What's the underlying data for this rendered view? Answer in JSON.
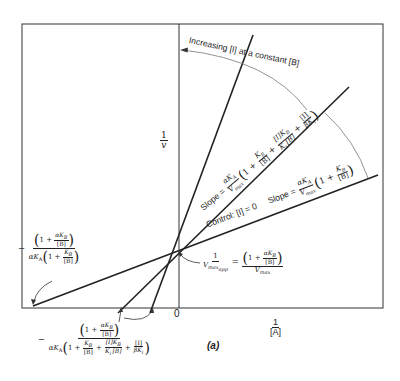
{
  "figure": {
    "panel_label": "(a)",
    "x_axis": {
      "label_num": "1",
      "label_den": "[A]",
      "origin_label": "0"
    },
    "y_axis": {
      "label_num": "1",
      "label_den": "v"
    },
    "arrow_annotation": "Increasing [I] at a constant [B]",
    "lines": [
      {
        "name": "control",
        "label": "Control: [I] = 0"
      },
      {
        "name": "inhibited-middle"
      },
      {
        "name": "inhibited-steep"
      }
    ],
    "slope_control": {
      "prefix": "Slope =",
      "num": "αK",
      "num_sub": "A",
      "den": "V",
      "den_sub": "max",
      "term1": "1 +",
      "term2_num": "K",
      "term2_num_sub": "B",
      "term2_den": "[B]"
    },
    "slope_inhibited": {
      "prefix": "Slope =",
      "num": "αK",
      "num_sub": "A",
      "den": "V",
      "den_sub": "max",
      "term1": "1 +",
      "t2_num": "K",
      "t2_num_sub": "B",
      "t2_den": "[B]",
      "plus1": "+",
      "t3_num": "[I]K",
      "t3_num_sub": "B",
      "t3_den": "K",
      "t3_den_sub": "i",
      "t3_den_rest": "[B]",
      "plus2": "+",
      "t4_num": "[I]",
      "t4_den": "βK",
      "t4_den_sub": "i"
    },
    "vmax_app": {
      "lhs_num": "1",
      "lhs_den": "V",
      "lhs_den_sub": "max",
      "lhs_den_subsub": "app",
      "eq": "=",
      "rhs_term": "1 +",
      "rhs_inner_num": "αK",
      "rhs_inner_num_sub": "B",
      "rhs_inner_den": "[B]",
      "rhs_den": "V",
      "rhs_den_sub": "max"
    },
    "intercept_control": {
      "sign": "−",
      "num_term": "1 +",
      "num_inner_num": "αK",
      "num_inner_num_sub": "B",
      "num_inner_den": "[B]",
      "den_prefix": "αK",
      "den_prefix_sub": "A",
      "den_term": "1 +",
      "den_inner_num": "K",
      "den_inner_num_sub": "B",
      "den_inner_den": "[B]"
    },
    "intercept_inhibited": {
      "sign": "−",
      "num_term": "1 +",
      "num_inner_num": "αK",
      "num_inner_num_sub": "B",
      "num_inner_den": "[B]",
      "den_prefix": "αK",
      "den_prefix_sub": "A",
      "den_term": "1 +",
      "d2_num": "K",
      "d2_num_sub": "B",
      "d2_den": "[B]",
      "plus1": "+",
      "d3_num": "[I]K",
      "d3_num_sub": "B",
      "d3_den": "K",
      "d3_den_sub": "i",
      "d3_den_rest": "[B]",
      "plus2": "+",
      "d4_num": "[I]",
      "d4_den": "βK",
      "d4_den_sub": "i"
    },
    "colors": {
      "ink": "#222222",
      "thin": "#777777",
      "background": "#ffffff"
    }
  }
}
